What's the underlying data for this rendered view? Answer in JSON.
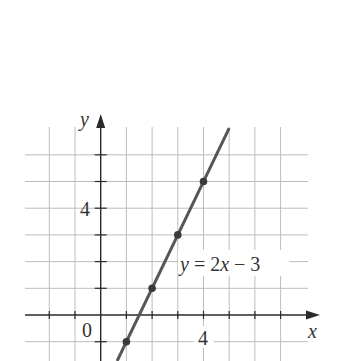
{
  "chart_data": {
    "type": "line",
    "title": "",
    "xlabel": "x",
    "ylabel": "y",
    "xlim": [
      -3,
      8
    ],
    "ylim": [
      -2,
      7
    ],
    "grid": true,
    "x_tick_labels": [
      {
        "value": 0,
        "label": "0"
      },
      {
        "value": 4,
        "label": "4"
      }
    ],
    "y_tick_labels": [
      {
        "value": 4,
        "label": "4"
      }
    ],
    "x_gridlines": [
      -2,
      -1,
      0,
      1,
      2,
      3,
      4,
      5,
      6,
      7
    ],
    "y_gridlines": [
      -1,
      0,
      1,
      2,
      3,
      4,
      5,
      6
    ],
    "series": [
      {
        "name": "y = 2x − 3",
        "equation": "y = 2x - 3",
        "slope": 2,
        "intercept": -3,
        "line_x_range": [
          0.64,
          5
        ],
        "points": [
          {
            "x": 1,
            "y": -1
          },
          {
            "x": 2,
            "y": 1
          },
          {
            "x": 3,
            "y": 3
          },
          {
            "x": 4,
            "y": 5
          }
        ],
        "color": "#565656"
      }
    ],
    "annotations": [
      {
        "text": "y = 2x − 3",
        "near": {
          "x": 3,
          "y": 2
        }
      }
    ],
    "legend": "none"
  },
  "labels": {
    "x_axis": "x",
    "y_axis": "y",
    "origin": "0",
    "x_tick_4": "4",
    "y_tick_4": "4",
    "eq_y": "y",
    "eq_mid": " = 2",
    "eq_x": "x",
    "eq_tail": " − 3"
  },
  "colors": {
    "grid": "#bdbdbd",
    "axis": "#2a2a2a",
    "line": "#565656",
    "points": "#3a3a3a",
    "background": "#ffffff"
  }
}
